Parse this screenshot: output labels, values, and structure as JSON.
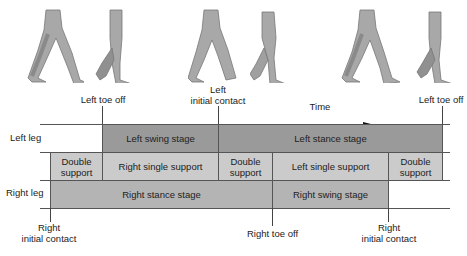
{
  "figures": [
    {
      "name": "figure-1",
      "x": 24,
      "y": 8
    },
    {
      "name": "figure-2",
      "x": 92,
      "y": 8
    },
    {
      "name": "figure-3",
      "x": 188,
      "y": 8
    },
    {
      "name": "figure-4",
      "x": 250,
      "y": 8
    },
    {
      "name": "figure-5",
      "x": 340,
      "y": 8
    },
    {
      "name": "figure-6",
      "x": 415,
      "y": 8
    }
  ],
  "events_top": {
    "left_toe_off_1": "Left toe off",
    "left_initial_contact_line1": "Left",
    "left_initial_contact_line2": "initial contact",
    "time": "Time",
    "left_toe_off_2": "Left toe off"
  },
  "row_labels": {
    "left_leg": "Left leg",
    "right_leg": "Right leg"
  },
  "left_row": {
    "swing": "Left swing stage",
    "stance": "Left stance stage"
  },
  "support_row": {
    "double_1_line1": "Double",
    "double_1_line2": "support",
    "right_single": "Right single support",
    "double_2_line1": "Double",
    "double_2_line2": "support",
    "left_single": "Left single support",
    "double_3_line1": "Double",
    "double_3_line2": "support"
  },
  "right_row": {
    "stance": "Right stance stage",
    "swing": "Right swing stage"
  },
  "events_bottom": {
    "right_initial_contact_1_line1": "Right",
    "right_initial_contact_1_line2": "initial contact",
    "right_toe_off": "Right toe off",
    "right_initial_contact_2_line1": "Right",
    "right_initial_contact_2_line2": "initial contact"
  },
  "colors": {
    "swing_stance_dark": "#9a9a9a",
    "stance_mid": "#b4b4b4",
    "support_light": "#cbcbcb"
  }
}
